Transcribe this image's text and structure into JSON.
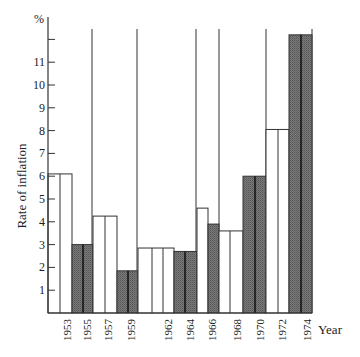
{
  "chart_data": {
    "type": "bar",
    "title": "",
    "xlabel": "Year",
    "ylabel": "Rate of inflation",
    "y_unit_label": "%",
    "ylim": [
      0,
      12.5
    ],
    "yticks": [
      1,
      2,
      3,
      4,
      5,
      6,
      7,
      8,
      9,
      10,
      11,
      12
    ],
    "ytick_labels": [
      "1",
      "2",
      "3",
      "4",
      "5",
      "6",
      "7",
      "8",
      "9",
      "10",
      "11",
      ""
    ],
    "grid": false,
    "legend": null,
    "categories": [
      "1953",
      "1955",
      "1957",
      "1959",
      "1962",
      "1964",
      "1966",
      "1968",
      "1970",
      "1972",
      "1974"
    ],
    "bars": [
      {
        "label": "1953",
        "value": 6.1,
        "fill": "white",
        "x0": 48,
        "x1": 72,
        "dividers": [
          60
        ]
      },
      {
        "label": "1955",
        "value": 3.0,
        "fill": "gray",
        "x0": 72,
        "x1": 93,
        "dividers": [
          83
        ]
      },
      {
        "label": "1957",
        "value": 4.25,
        "fill": "white",
        "x0": 93,
        "x1": 117,
        "dividers": [
          105
        ]
      },
      {
        "label": "1959",
        "value": 1.85,
        "fill": "gray",
        "x0": 117,
        "x1": 138,
        "dividers": [
          128
        ]
      },
      {
        "label": "1962",
        "value": 2.85,
        "fill": "white",
        "x0": 138,
        "x1": 174,
        "dividers": [
          152,
          163
        ]
      },
      {
        "label": "1964",
        "value": 2.7,
        "fill": "gray",
        "x0": 174,
        "x1": 197,
        "dividers": [
          185
        ]
      },
      {
        "label": "1966a",
        "value": 4.6,
        "fill": "white",
        "x0": 197,
        "x1": 208,
        "dividers": []
      },
      {
        "label": "1966b",
        "value": 3.9,
        "fill": "gray",
        "x0": 208,
        "x1": 219,
        "dividers": []
      },
      {
        "label": "1968",
        "value": 3.6,
        "fill": "white",
        "x0": 219,
        "x1": 243,
        "dividers": [
          230
        ]
      },
      {
        "label": "1970",
        "value": 6.0,
        "fill": "gray",
        "x0": 243,
        "x1": 266,
        "dividers": [
          255
        ]
      },
      {
        "label": "1972",
        "value": 8.05,
        "fill": "white",
        "x0": 266,
        "x1": 289,
        "dividers": [
          278
        ]
      },
      {
        "label": "1974",
        "value": 12.2,
        "fill": "gray",
        "x0": 289,
        "x1": 312,
        "dividers": [
          301
        ]
      }
    ],
    "values": [
      6.1,
      3.0,
      4.25,
      1.85,
      2.85,
      2.7,
      4.6,
      3.6,
      6.0,
      8.05,
      12.2
    ],
    "series": [
      {
        "name": "Rate of inflation (%)",
        "values": [
          6.1,
          3.0,
          4.25,
          1.85,
          2.85,
          2.7,
          4.6,
          3.6,
          6.0,
          8.05,
          12.2
        ]
      }
    ],
    "separator_lines_x": [
      92,
      137,
      196,
      219,
      266,
      312
    ],
    "year_label_positions": [
      {
        "label": "1953",
        "x": 67
      },
      {
        "label": "1955",
        "x": 87
      },
      {
        "label": "1957",
        "x": 108
      },
      {
        "label": "1959",
        "x": 131
      },
      {
        "label": "1962",
        "x": 168
      },
      {
        "label": "1964",
        "x": 190
      },
      {
        "label": "1966",
        "x": 212
      },
      {
        "label": "1968",
        "x": 237
      },
      {
        "label": "1970",
        "x": 260
      },
      {
        "label": "1972",
        "x": 282
      },
      {
        "label": "1974",
        "x": 307
      }
    ]
  },
  "colors": {
    "axis": "#333333",
    "white_bar_fill": "#ffffff",
    "gray_bar_fill": "#6e6e6e",
    "bar_stroke": "#333333",
    "gray_divider": "#111111"
  }
}
